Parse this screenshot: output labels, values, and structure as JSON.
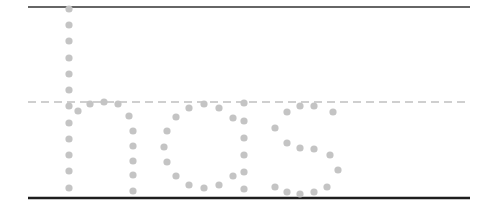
{
  "worksheet": {
    "practice_text": "hos",
    "letters": [
      "h",
      "o",
      "s"
    ],
    "colors": {
      "dot": "#c4c4c4",
      "guide_line": "#333333",
      "baseline": "#1e1e1e",
      "midline": "#c0c0c0",
      "background": "#ffffff"
    },
    "guides": {
      "x_start": 28,
      "x_end": 470,
      "top_line_y": 7,
      "midline_y": 102,
      "baseline_y": 198
    },
    "dot_radius": 3.6,
    "strokes": [
      {
        "letter": "h",
        "part": "stem",
        "points": [
          [
            69,
            9
          ],
          [
            69,
            25
          ],
          [
            69,
            41
          ],
          [
            69,
            58
          ],
          [
            69,
            74
          ],
          [
            69,
            90
          ],
          [
            69,
            106
          ],
          [
            69,
            123
          ],
          [
            69,
            139
          ],
          [
            69,
            155
          ],
          [
            69,
            171
          ],
          [
            69,
            188
          ]
        ]
      },
      {
        "letter": "h",
        "part": "arch",
        "points": [
          [
            78,
            111
          ],
          [
            90,
            104
          ],
          [
            104,
            102
          ],
          [
            118,
            104
          ],
          [
            129,
            116
          ]
        ]
      },
      {
        "letter": "h",
        "part": "right-leg",
        "points": [
          [
            133,
            131
          ],
          [
            133,
            146
          ],
          [
            133,
            161
          ],
          [
            133,
            175
          ],
          [
            133,
            191
          ]
        ]
      },
      {
        "letter": "o",
        "part": "bowl",
        "points": [
          [
            189,
            108
          ],
          [
            204,
            104
          ],
          [
            219,
            108
          ],
          [
            233,
            118
          ],
          [
            176,
            117
          ],
          [
            167,
            131
          ],
          [
            164,
            147
          ],
          [
            167,
            162
          ],
          [
            176,
            176
          ],
          [
            189,
            185
          ],
          [
            204,
            188
          ],
          [
            219,
            185
          ],
          [
            233,
            176
          ]
        ]
      },
      {
        "letter": "o",
        "part": "right-stroke",
        "points": [
          [
            244,
            103
          ],
          [
            244,
            121
          ],
          [
            244,
            138
          ],
          [
            244,
            155
          ],
          [
            244,
            172
          ],
          [
            244,
            189
          ]
        ]
      },
      {
        "letter": "s",
        "part": "curve",
        "points": [
          [
            287,
            112
          ],
          [
            300,
            106
          ],
          [
            314,
            106
          ],
          [
            333,
            112
          ],
          [
            275,
            128
          ],
          [
            287,
            143
          ],
          [
            300,
            148
          ],
          [
            314,
            149
          ],
          [
            330,
            155
          ],
          [
            338,
            170
          ],
          [
            275,
            187
          ],
          [
            287,
            192
          ],
          [
            300,
            194
          ],
          [
            314,
            192
          ],
          [
            327,
            187
          ]
        ]
      }
    ]
  }
}
